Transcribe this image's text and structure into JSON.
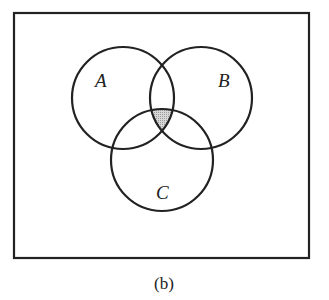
{
  "diagram": {
    "type": "venn",
    "caption": "(b)",
    "sets": [
      {
        "label": "A",
        "cx": 123,
        "cy": 98,
        "r": 51
      },
      {
        "label": "B",
        "cx": 201,
        "cy": 98,
        "r": 51
      },
      {
        "label": "C",
        "cx": 162,
        "cy": 160,
        "r": 51
      }
    ],
    "shaded_region": "A ∩ B ∩ C",
    "colors": {
      "stroke": "#222222",
      "shade": "#bdbdbd",
      "background": "#ffffff"
    }
  }
}
